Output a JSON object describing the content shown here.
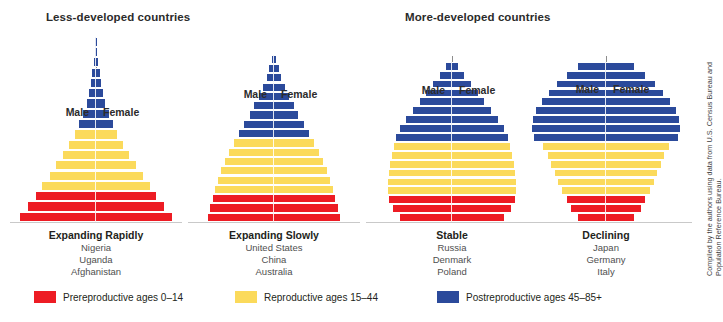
{
  "headings": {
    "less_developed": "Less-developed countries",
    "more_developed": "More-developed countries"
  },
  "sex_labels": {
    "male": "Male",
    "female": "Female"
  },
  "colors": {
    "prereproductive": "#ED1C24",
    "reproductive": "#FBDA5B",
    "postreproductive": "#2B4A9B",
    "baseline": "#C9C9C9",
    "spire": "#8D8D8D",
    "text": "#231F20"
  },
  "legend": {
    "items": [
      {
        "label": "Prereproductive ages 0–14",
        "color": "#ED1C24",
        "ages": "0-14"
      },
      {
        "label": "Reproductive ages 15–44",
        "color": "#FBDA5B",
        "ages": "15-44"
      },
      {
        "label": "Postreproductive ages 45–85+",
        "color": "#2B4A9B",
        "ages": "45-85+"
      }
    ]
  },
  "source_credit": "Compiled by the authors using data from U.S. Census Bureau and Population Reference Bureau.",
  "chart_data": {
    "type": "bar",
    "subtitle": "",
    "xlabel": "Population by sex",
    "ylabel": "Age group",
    "orientation": "horizontal-bilateral",
    "grid": false,
    "legend_position": "bottom",
    "age_groups": [
      "0–4",
      "5–9",
      "10–14",
      "15–19",
      "20–24",
      "25–29",
      "30–34",
      "35–39",
      "40–44",
      "45–49",
      "50–54",
      "55–59",
      "60–64",
      "65–69",
      "70–74",
      "75–79",
      "80–84",
      "85+"
    ],
    "age_group_colors": [
      "prereproductive",
      "prereproductive",
      "prereproductive",
      "reproductive",
      "reproductive",
      "reproductive",
      "reproductive",
      "reproductive",
      "reproductive",
      "postreproductive",
      "postreproductive",
      "postreproductive",
      "postreproductive",
      "postreproductive",
      "postreproductive",
      "postreproductive",
      "postreproductive",
      "postreproductive"
    ],
    "panels": [
      {
        "id": "expanding-rapidly",
        "group": "Less-developed countries",
        "caption_title": "Expanding Rapidly",
        "countries": [
          "Nigeria",
          "Uganda",
          "Afghanistan"
        ],
        "series": [
          {
            "name": "Male",
            "values": [
              8.2,
              7.3,
              6.5,
              5.8,
              5.0,
              4.3,
              3.6,
              2.9,
              2.3,
              1.8,
              1.35,
              1.0,
              0.75,
              0.55,
              0.38,
              0.25,
              0.15,
              0.07
            ]
          },
          {
            "name": "Female",
            "values": [
              8.2,
              7.3,
              6.5,
              5.8,
              5.0,
              4.3,
              3.6,
              2.9,
              2.3,
              1.8,
              1.35,
              1.0,
              0.75,
              0.55,
              0.38,
              0.25,
              0.15,
              0.07
            ]
          }
        ]
      },
      {
        "id": "expanding-slowly",
        "group": "Less-developed countries",
        "caption_title": "Expanding Slowly",
        "countries": [
          "United States",
          "China",
          "Australia"
        ],
        "series": [
          {
            "name": "Male",
            "values": [
              6.2,
              6.0,
              5.8,
              5.6,
              5.3,
              5.0,
              4.6,
              4.2,
              3.8,
              3.3,
              2.8,
              2.3,
              1.85,
              1.4,
              1.0,
              0.7,
              0.45,
              0.22
            ]
          },
          {
            "name": "Female",
            "values": [
              6.2,
              6.0,
              5.8,
              5.6,
              5.3,
              5.0,
              4.6,
              4.2,
              3.8,
              3.3,
              2.8,
              2.3,
              1.85,
              1.4,
              1.0,
              0.7,
              0.45,
              0.22
            ]
          }
        ]
      },
      {
        "id": "stable",
        "group": "More-developed countries",
        "caption_title": "Stable",
        "countries": [
          "Russia",
          "Denmark",
          "Poland"
        ],
        "series": [
          {
            "name": "Male",
            "values": [
              4.6,
              5.3,
              5.6,
              5.7,
              5.7,
              5.6,
              5.5,
              5.4,
              5.2,
              5.0,
              4.6,
              4.1,
              3.5,
              2.9,
              2.3,
              1.7,
              1.1,
              0.55
            ]
          },
          {
            "name": "Female",
            "values": [
              4.6,
              5.3,
              5.6,
              5.7,
              5.7,
              5.6,
              5.5,
              5.4,
              5.2,
              5.0,
              4.6,
              4.1,
              3.5,
              2.9,
              2.3,
              1.7,
              1.1,
              0.55
            ]
          }
        ]
      },
      {
        "id": "declining",
        "group": "More-developed countries",
        "caption_title": "Declining",
        "countries": [
          "Japan",
          "Germany",
          "Italy"
        ],
        "series": [
          {
            "name": "Male",
            "values": [
              2.4,
              3.0,
              3.4,
              3.8,
              4.1,
              4.4,
              4.7,
              5.0,
              5.4,
              6.2,
              6.4,
              6.3,
              6.0,
              5.5,
              4.9,
              4.2,
              3.4,
              2.4
            ]
          },
          {
            "name": "Female",
            "values": [
              2.4,
              3.0,
              3.4,
              3.8,
              4.1,
              4.4,
              4.7,
              5.0,
              5.4,
              6.2,
              6.4,
              6.3,
              6.0,
              5.5,
              4.9,
              4.2,
              3.4,
              2.4
            ]
          }
        ]
      }
    ]
  }
}
